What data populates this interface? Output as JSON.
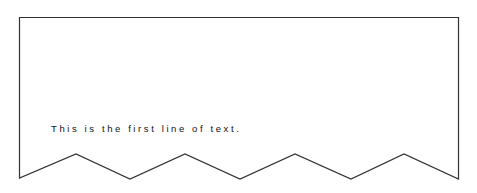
{
  "diagram": {
    "shape": "document",
    "stroke_color": "#333333",
    "fill_color": "#ffffff",
    "text_lines": [
      "This is the first line of text."
    ]
  }
}
